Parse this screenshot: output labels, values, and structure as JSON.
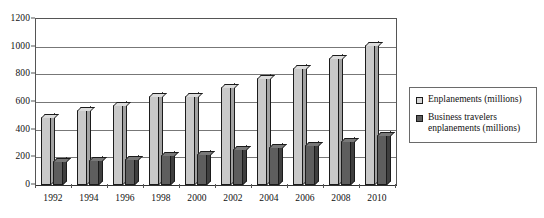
{
  "chart_data": {
    "type": "bar",
    "title": "",
    "subtitle": "",
    "xlabel": "",
    "ylabel": "",
    "ylim": [
      0,
      1200
    ],
    "yticks": [
      0,
      200,
      400,
      600,
      800,
      1000,
      1200
    ],
    "ytick_labels": [
      "0",
      "200",
      "400",
      "600",
      "800",
      "1000",
      "1200"
    ],
    "grid": "horizontal",
    "legend_position": "right",
    "style": "3d-grayscale-columns",
    "categories": [
      "1992",
      "1994",
      "1996",
      "1998",
      "2000",
      "2002",
      "2004",
      "2006",
      "2008",
      "2010"
    ],
    "series": [
      {
        "name": "Enplanements (millions)",
        "color": "#c9c9c9",
        "values": [
          490,
          545,
          580,
          640,
          645,
          710,
          775,
          845,
          920,
          1015
        ]
      },
      {
        "name": "Business travelers enplanements (millions)",
        "color": "#5e5e5e",
        "values": [
          170,
          180,
          190,
          215,
          225,
          260,
          275,
          290,
          320,
          360
        ]
      }
    ]
  },
  "legend": {
    "entries": [
      {
        "label": "Enplanements (millions)",
        "swatch": "light-gray-square"
      },
      {
        "label": "Business travelers enplanements (millions)",
        "swatch": "dark-gray-square"
      }
    ]
  },
  "colors": {
    "series_1_fill": "#c9c9c9",
    "series_1_side": "#a2a2a2",
    "series_1_top": "#dcdcdc",
    "series_2_fill": "#5e5e5e",
    "series_2_side": "#3f3f3f",
    "series_2_top": "#787878",
    "axis": "#555555",
    "gridline": "#777777",
    "outline": "#1b1b1b",
    "text": "#111111",
    "background": "#ffffff"
  }
}
